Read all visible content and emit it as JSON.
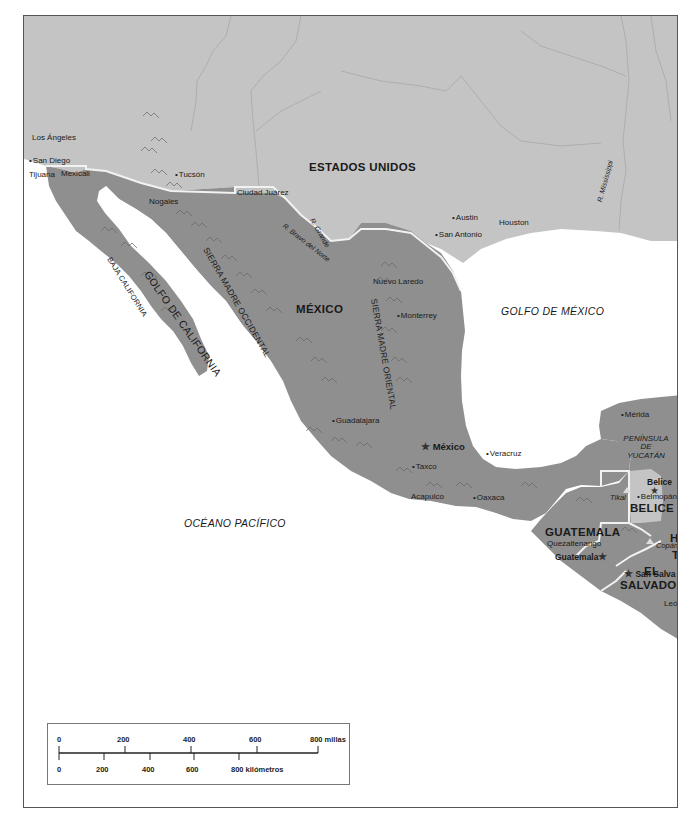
{
  "map": {
    "countries": {
      "usa": "ESTADOS UNIDOS",
      "mexico": "MÉXICO",
      "guatemala": "GUATEMALA",
      "belize": "BELICE",
      "el_salvador_1": "EL",
      "el_salvador_2": "SALVADOR",
      "honduras_partial": "H",
      "honduras_partial2": "T"
    },
    "water_bodies": {
      "gulf_california": "GOLFO DE CALIFORNIA",
      "gulf_mexico": "GOLFO DE MÉXICO",
      "pacific": "OCÉANO PACÍFICO"
    },
    "mountain_ranges": {
      "occidental": "SIERRA MADRE OCCIDENTAL",
      "oriental": "SIERRA MADRE ORIENTAL"
    },
    "regions": {
      "baja": "BAJA CALIFORNIA",
      "yucatan_1": "PENÍNSULA",
      "yucatan_2": "DE",
      "yucatan_3": "YUCATÁN"
    },
    "rivers": {
      "grande": "R. Grande",
      "bravo": "R. Bravo del Norte",
      "mississippi": "R. Mississippi"
    },
    "cities": {
      "los_angeles": "Los Ángeles",
      "san_diego": "San Diego",
      "tijuana": "Tijuana",
      "mexicali": "Mexicali",
      "tucson": "Tucsón",
      "nogales": "Nogales",
      "ciudad_juarez": "Ciudad Juárez",
      "austin": "Austin",
      "houston": "Houston",
      "san_antonio": "San Antonio",
      "nuevo_laredo": "Nuevo Laredo",
      "monterrey": "Monterrey",
      "guadalajara": "Guadalajara",
      "taxco": "Taxco",
      "veracruz": "Veracruz",
      "acapulco": "Acapulco",
      "oaxaca": "Oaxaca",
      "merida": "Mérida",
      "belmopan": "Belmopán",
      "quetzaltenango": "Quezaltenango",
      "leon_partial": "Leó"
    },
    "capitals": {
      "mexico": "México",
      "belize": "Belice",
      "guatemala": "Guatemala",
      "san_salvador": "San Salva"
    },
    "sites": {
      "tikal": "Tikal",
      "copan": "Copán"
    },
    "colors": {
      "foreign_land": "#c4c4c4",
      "focus_land": "#8f8f8f",
      "water": "#ffffff",
      "border": "#f2f2f2",
      "river": "#a8a8a8"
    }
  },
  "scale": {
    "miles_ticks": [
      "0",
      "200",
      "400",
      "600"
    ],
    "miles_end": "800 millas",
    "km_ticks": [
      "0",
      "200",
      "400",
      "600"
    ],
    "km_end": "800 kilómetros"
  }
}
